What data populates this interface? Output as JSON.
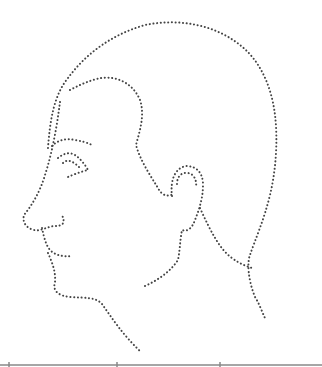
{
  "image": {
    "subject": "dotted outline of a human head in left-facing profile",
    "stroke_color": "#444444",
    "background": "#ffffff",
    "baseline_color": "#888888"
  }
}
